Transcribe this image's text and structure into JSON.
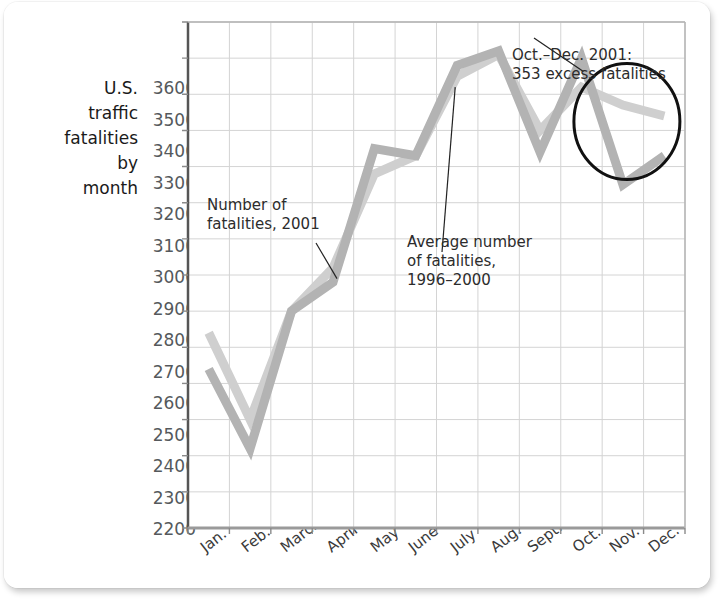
{
  "figure": {
    "y_axis_caption": "U.S.\ntraffic\nfatalities\nby\nmonth"
  },
  "annotations": {
    "series_2001": "Number of\nfatalities, 2001",
    "series_average": "Average number\nof fatalities,\n1996–2000",
    "highlight": "Oct.–Dec. 2001:\n353 excess fatalities"
  },
  "colors": {
    "line_2001": "#b3b3b3",
    "line_average": "#cfcfcf",
    "grid": "#d4d4d4",
    "axis": "#8a8a8a",
    "circle": "#111111",
    "text": "#2c2c2c",
    "tick_text": "#55595c"
  },
  "chart_data": {
    "type": "line",
    "title": "",
    "xlabel": "",
    "ylabel": "U.S. traffic fatalities by month",
    "ylim": [
      2200,
      3600
    ],
    "ytick_labels": [
      "3600",
      "3500",
      "3400",
      "3300",
      "3200",
      "3100",
      "3000",
      "2900",
      "2800",
      "2700",
      "2600",
      "2500",
      "2400",
      "2300",
      "2200"
    ],
    "ytick_values": [
      3600,
      3500,
      3400,
      3300,
      3200,
      3100,
      3000,
      2900,
      2800,
      2700,
      2600,
      2500,
      2400,
      2300,
      2200
    ],
    "grid": true,
    "legend": "annotated-inline",
    "categories": [
      "Jan.",
      "Feb.",
      "March",
      "April",
      "May",
      "June",
      "July",
      "Aug.",
      "Sept.",
      "Oct.",
      "Nov.",
      "Dec."
    ],
    "series": [
      {
        "name": "Number of fatalities, 2001",
        "color": "#b3b3b3",
        "values": [
          2640,
          2420,
          2800,
          2880,
          3250,
          3230,
          3480,
          3520,
          3240,
          3500,
          3150,
          3230
        ]
      },
      {
        "name": "Average number of fatalities, 1996–2000",
        "color": "#cfcfcf",
        "values": [
          2740,
          2500,
          2800,
          2920,
          3180,
          3230,
          3450,
          3510,
          3300,
          3420,
          3370,
          3340
        ]
      }
    ],
    "annotation_note": "Oct.–Dec. 2001: 353 excess fatalities"
  }
}
